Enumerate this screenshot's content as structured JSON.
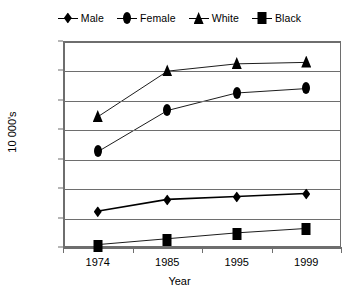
{
  "chart_data": {
    "type": "line",
    "title": "",
    "xlabel": "Year",
    "ylabel": "10 000's",
    "categories": [
      "1974",
      "1985",
      "1995",
      "1999"
    ],
    "x": [
      1974,
      1985,
      1995,
      1999
    ],
    "ylim": [
      2,
      142
    ],
    "yticks": [
      2,
      22,
      42,
      62,
      82,
      102,
      122,
      142
    ],
    "grid": true,
    "legend_position": "top-center",
    "series": [
      {
        "name": "Male",
        "marker": "diamond",
        "values": [
          26,
          34,
          36,
          38
        ]
      },
      {
        "name": "Female",
        "marker": "ellipse",
        "values": [
          67,
          95,
          107,
          110
        ]
      },
      {
        "name": "White",
        "marker": "triangle",
        "values": [
          91,
          122,
          127,
          128
        ]
      },
      {
        "name": "Black",
        "marker": "square",
        "values": [
          3,
          7,
          11,
          14
        ]
      }
    ],
    "colors": {
      "series": "#000000",
      "grid": "#6e6e6e",
      "axis": "#6e6e6e",
      "background": "#ffffff"
    }
  },
  "legend": {
    "items": [
      {
        "label": "Male",
        "marker": "diamond"
      },
      {
        "label": "Female",
        "marker": "ellipse"
      },
      {
        "label": "White",
        "marker": "triangle"
      },
      {
        "label": "Black",
        "marker": "square"
      }
    ]
  }
}
